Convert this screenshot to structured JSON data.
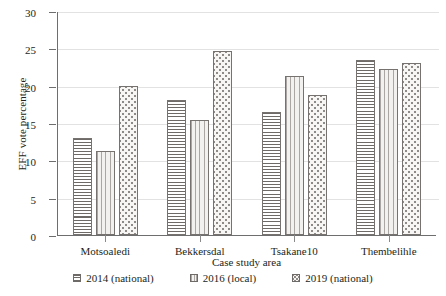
{
  "chart_data": {
    "type": "bar",
    "title": "",
    "subtitle": "",
    "xlabel": "Case study area",
    "ylabel": "EFF vote percentage",
    "categories": [
      "Motsoaledi",
      "Bekkersdal",
      "Tsakane10",
      "Thembelihle"
    ],
    "series": [
      {
        "name": "2014 (national)",
        "pattern": "horizontal-lines",
        "values": [
          13.0,
          18.2,
          16.5,
          23.5
        ]
      },
      {
        "name": "2016 (local)",
        "pattern": "vertical-lines",
        "values": [
          11.3,
          15.5,
          21.4,
          22.4
        ]
      },
      {
        "name": "2019 (national)",
        "pattern": "dots",
        "values": [
          20.0,
          24.7,
          18.8,
          23.1
        ]
      }
    ],
    "ylim": [
      0,
      30
    ],
    "yticks": [
      0,
      5,
      10,
      15,
      20,
      25,
      30
    ],
    "ytick_labels": [
      "0",
      "5",
      "10",
      "15",
      "20",
      "25",
      "30"
    ],
    "grid": "horizontal",
    "legend_position": "bottom",
    "colors": {
      "axis": "#6e6e6e",
      "grid": "#e2e2e2",
      "bar_outline": "#76726f",
      "text": "#231f20",
      "background": "#ffffff"
    }
  }
}
